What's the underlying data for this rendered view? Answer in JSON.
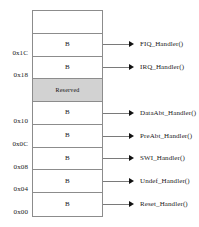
{
  "diagram": {
    "branch_instruction": "B",
    "reserved_label": "Reserved",
    "rows": [
      {
        "address": "",
        "instruction": "",
        "handler": "",
        "reserved": false,
        "empty": true
      },
      {
        "address": "0x1C",
        "instruction": "B",
        "handler": "FIQ_Handler()",
        "reserved": false,
        "empty": false
      },
      {
        "address": "0x18",
        "instruction": "B",
        "handler": "IRQ_Handler()",
        "reserved": false,
        "empty": false
      },
      {
        "address": "",
        "instruction": "Reserved",
        "handler": "",
        "reserved": true,
        "empty": false
      },
      {
        "address": "0x10",
        "instruction": "B",
        "handler": "DataAbt_Handler()",
        "reserved": false,
        "empty": false
      },
      {
        "address": "0x0C",
        "instruction": "B",
        "handler": "PreAbt_Handler()",
        "reserved": false,
        "empty": false
      },
      {
        "address": "0x08",
        "instruction": "B",
        "handler": "SWI_Handler()",
        "reserved": false,
        "empty": false
      },
      {
        "address": "0x04",
        "instruction": "B",
        "handler": "Undef_Handler()",
        "reserved": false,
        "empty": false
      },
      {
        "address": "0x00",
        "instruction": "B",
        "handler": "Reset_Handler()",
        "reserved": false,
        "empty": false
      }
    ],
    "colors": {
      "background": "#ffffff",
      "border": "#8c8c8c",
      "text": "#1a1a1a",
      "connector": "#7a7a7a",
      "arrow": "#111111",
      "reserved_fill": "#d2d2d2",
      "reserved_dots": "#6e6e6e"
    }
  }
}
